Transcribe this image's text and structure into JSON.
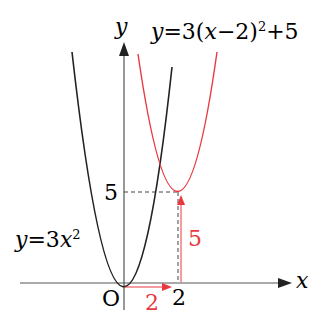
{
  "axes": {
    "x_label": "x",
    "y_label": "y",
    "origin_label": "O"
  },
  "curves": [
    {
      "name": "base",
      "equation": "y=3x²",
      "eq_prefix": "y=3",
      "eq_var": "x",
      "eq_exp": "2",
      "color": "#222222"
    },
    {
      "name": "shifted",
      "equation": "y=3(x−2)²+5",
      "eq_prefix": "y=3",
      "eq_inner": "(x−2)",
      "eq_exp": "2",
      "eq_suffix": "+5",
      "color": "#e8393f"
    }
  ],
  "ticks": {
    "x_tick": "2",
    "y_tick": "5"
  },
  "shift_annotations": {
    "horizontal": "2",
    "vertical": "5",
    "color": "#e8393f"
  }
}
